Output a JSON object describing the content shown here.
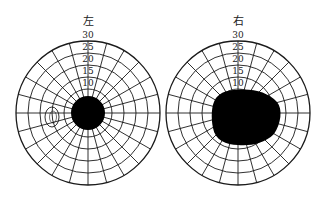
{
  "figure": {
    "left_field": {
      "title": "左",
      "ring_labels": [
        "30",
        "25",
        "20",
        "15",
        "10"
      ],
      "center": [
        88,
        113
      ],
      "outer_radius": 72,
      "scotoma": "central round dark spot",
      "blind_spot": "small oval outline left of center"
    },
    "right_field": {
      "title": "右",
      "ring_labels": [
        "30",
        "25",
        "20",
        "15",
        "10"
      ],
      "center": [
        238,
        113
      ],
      "outer_radius": 72,
      "scotoma": "large irregular dark area extending right of center"
    },
    "colors": {
      "line": "#1a1a1a",
      "fill": "#000000",
      "background": "#ffffff"
    }
  }
}
